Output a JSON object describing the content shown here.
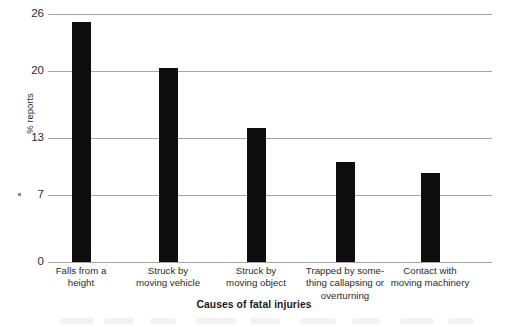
{
  "chart_data": {
    "type": "bar",
    "title": "",
    "xlabel": "Causes of fatal injuries",
    "ylabel": "% reports",
    "categories": [
      "Falls from a height",
      "Struck by moving vehicle",
      "Struck by moving object",
      "Trapped by some-thing callapsing or overturning",
      "Contact with moving machinery"
    ],
    "values": [
      25.2,
      20.3,
      14.0,
      10.5,
      9.3
    ],
    "ylim": [
      0,
      26
    ],
    "yticks": [
      0,
      7,
      13,
      20,
      26
    ],
    "ytick_labels": [
      "0",
      "7",
      "13",
      "20",
      "26"
    ],
    "grid": true,
    "legend": "none",
    "bar_color": "#0d0d0d"
  },
  "axes": {
    "y_title": "% reports",
    "x_title": "Causes of fatal injuries",
    "y_tick_labels": [
      "26",
      "20",
      "13",
      "7",
      "0"
    ]
  },
  "categories_wrapped": [
    [
      "Falls from a",
      "height"
    ],
    [
      "Struck by",
      "moving vehicle"
    ],
    [
      "Struck by",
      "moving object"
    ],
    [
      "Trapped by some-",
      "thing callapsing or",
      "overturning"
    ],
    [
      "Contact with",
      "moving machinery"
    ]
  ]
}
